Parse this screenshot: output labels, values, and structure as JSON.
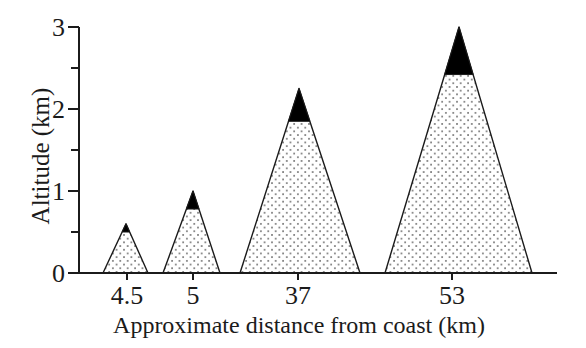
{
  "chart_data": {
    "type": "area",
    "title": "",
    "xlabel": "Approximate distance from coast (km)",
    "ylabel": "Altitude (km)",
    "ylim": [
      0,
      3
    ],
    "xtick_labels": [
      "4.5",
      "5",
      "37",
      "53"
    ],
    "y_major_ticks": [
      3,
      2,
      1,
      0
    ],
    "y_minor_ticks": [
      2.5,
      1.5,
      0.5
    ],
    "grid": "off",
    "legend": "none",
    "mountains": [
      {
        "distance_label": "4.5",
        "peak_altitude_km": 0.6,
        "snowline_altitude_km": 0.5,
        "tick_x": 127,
        "base_left_x": 103,
        "base_right_x": 148,
        "peak_x": 126
      },
      {
        "distance_label": "5",
        "peak_altitude_km": 1.0,
        "snowline_altitude_km": 0.78,
        "tick_x": 193,
        "base_left_x": 163,
        "base_right_x": 220,
        "peak_x": 193
      },
      {
        "distance_label": "37",
        "peak_altitude_km": 2.25,
        "snowline_altitude_km": 1.85,
        "tick_x": 298,
        "base_left_x": 240,
        "base_right_x": 360,
        "peak_x": 299
      },
      {
        "distance_label": "53",
        "peak_altitude_km": 3.0,
        "snowline_altitude_km": 2.42,
        "tick_x": 452,
        "base_left_x": 385,
        "base_right_x": 532,
        "peak_x": 459
      }
    ],
    "colors": {
      "line": "#1b1b1b",
      "snow_cap": "#000000",
      "stipple_dot": "#606060",
      "background": "#ffffff"
    },
    "layout": {
      "axis_x": 79,
      "baseline_y": 273,
      "px_per_km": 82,
      "x_axis_end_x": 557,
      "major_tick_len": 11,
      "minor_tick_len": 8,
      "x_tick_len": 7
    }
  }
}
